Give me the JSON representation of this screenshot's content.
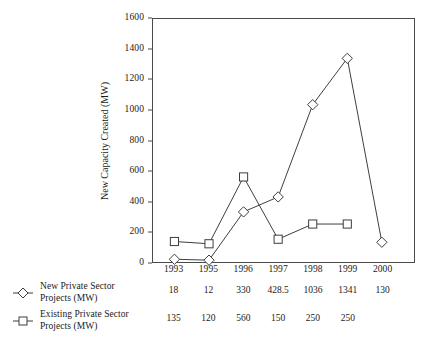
{
  "chart_data": {
    "type": "line",
    "title": "",
    "xlabel": "",
    "ylabel": "New Capacity Created (MW)",
    "categories": [
      "1993",
      "1995",
      "1996",
      "1997",
      "1998",
      "1999",
      "2000"
    ],
    "ylim": [
      0,
      1600
    ],
    "y_ticks": [
      0,
      200,
      400,
      600,
      800,
      1000,
      1200,
      1400,
      1600
    ],
    "y_tick_labels": [
      "0",
      "200",
      "400",
      "600",
      "800",
      "1000",
      "1200",
      "1400",
      "1600"
    ],
    "grid": false,
    "legend_position": "below-left",
    "series": [
      {
        "name": "New Private Sector Projects (MW)",
        "marker": "diamond",
        "color": "#3c3c3c",
        "values": [
          18,
          12,
          330,
          428.5,
          1036,
          1341,
          130
        ],
        "value_labels": [
          "18",
          "12",
          "330",
          "428.5",
          "1036",
          "1341",
          "130"
        ]
      },
      {
        "name": "Existing Private Sector Projects (MW)",
        "marker": "square",
        "color": "#3c3c3c",
        "values": [
          135,
          120,
          560,
          150,
          250,
          250,
          null
        ],
        "value_labels": [
          "135",
          "120",
          "560",
          "150",
          "250",
          "250",
          ""
        ]
      }
    ]
  },
  "legend": {
    "rows": [
      {
        "label_line1": "New Private Sector",
        "label_line2": "Projects (MW)",
        "marker": "diamond-marker-icon"
      },
      {
        "label_line1": "Existing Private Sector",
        "label_line2": "Projects (MW)",
        "marker": "square-marker-icon"
      }
    ]
  },
  "axes": {
    "y_title": "New Capacity Created (MW)"
  }
}
